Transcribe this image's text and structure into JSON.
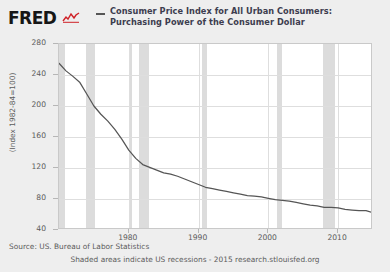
{
  "brand": {
    "logo_text": "FRED",
    "logo_icon": "red-chart-squiggle-icon",
    "accent_color": "#cf2127"
  },
  "legend": {
    "series_label": "Consumer Price Index for All Urban Consumers: Purchasing Power of the Consumer Dollar",
    "line_color": "#555555"
  },
  "footer": {
    "source": "Source: US. Bureau of Labor Statistics",
    "attribution": "Shaded areas indicate US recessions - 2015 research.stlouisfed.org"
  },
  "chart_data": {
    "type": "line",
    "title": "Consumer Price Index for All Urban Consumers: Purchasing Power of the Consumer Dollar",
    "xlabel": "",
    "ylabel": "(Index 1982-84=100)",
    "xlim": [
      1970,
      2015
    ],
    "ylim": [
      20,
      290
    ],
    "grid": true,
    "legend_position": "top",
    "yticks": [
      280,
      240,
      200,
      160,
      120,
      80,
      40
    ],
    "xticks": [
      1980,
      1990,
      2000,
      2010
    ],
    "series": [
      {
        "name": "Purchasing Power of the Consumer Dollar",
        "color": "#555555",
        "x": [
          1970,
          1971,
          1972,
          1973,
          1974,
          1975,
          1976,
          1977,
          1978,
          1979,
          1980,
          1981,
          1982,
          1983,
          1984,
          1985,
          1986,
          1987,
          1988,
          1989,
          1990,
          1991,
          1992,
          1993,
          1994,
          1995,
          1996,
          1997,
          1998,
          1999,
          2000,
          2001,
          2002,
          2003,
          2004,
          2005,
          2006,
          2007,
          2008,
          2009,
          2010,
          2011,
          2012,
          2013,
          2014,
          2015
        ],
        "y": [
          262,
          251,
          243,
          234,
          217,
          200,
          188,
          178,
          166,
          152,
          136,
          124,
          115,
          111,
          107,
          103,
          101,
          98,
          94,
          90,
          86,
          82,
          80,
          78,
          76,
          74,
          72,
          70,
          69,
          68,
          66,
          64,
          63,
          62,
          60,
          58,
          56,
          55,
          53,
          53,
          52,
          50,
          49,
          48,
          48,
          45
        ]
      }
    ],
    "recessions": [
      {
        "start": 1969.9,
        "end": 1970.9
      },
      {
        "start": 1973.9,
        "end": 1975.2
      },
      {
        "start": 1980.0,
        "end": 1980.5
      },
      {
        "start": 1981.5,
        "end": 1982.9
      },
      {
        "start": 1990.5,
        "end": 1991.2
      },
      {
        "start": 2001.2,
        "end": 2001.9
      },
      {
        "start": 2007.9,
        "end": 2009.5
      }
    ]
  }
}
